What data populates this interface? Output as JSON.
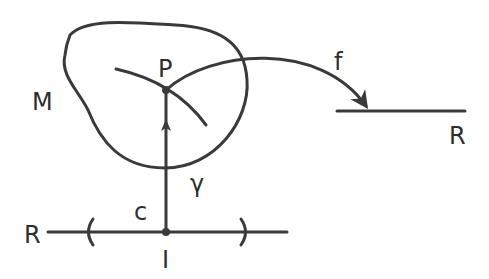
{
  "diagram": {
    "labels": {
      "manifold": "M",
      "point": "P",
      "map": "f",
      "target_line": "R",
      "source_line": "R",
      "curve": "γ",
      "parameter_curve": "c",
      "interval_point": "I"
    },
    "stroke_color": "#3a3a3a",
    "background": "#ffffff"
  }
}
